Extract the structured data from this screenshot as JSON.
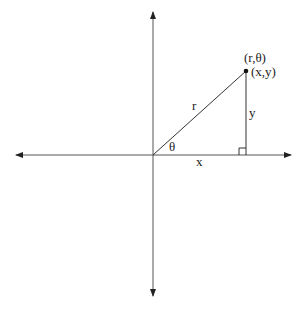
{
  "diagram": {
    "point_label_polar": "(r,θ)",
    "point_label_cartesian": "(x,y)",
    "hypotenuse_label": "r",
    "vertical_leg_label": "y",
    "horizontal_leg_label": "x",
    "angle_label": "θ",
    "colors": {
      "line": "#333333",
      "text": "#222222",
      "background": "#ffffff"
    }
  }
}
